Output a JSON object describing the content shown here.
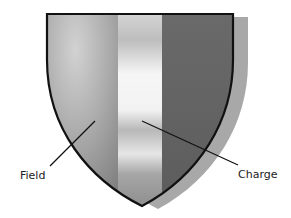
{
  "diagram": {
    "labels": {
      "field": "Field",
      "charge": "Charge"
    },
    "colors": {
      "outline": "#111111",
      "shadow": "#a8a8a8",
      "field_light": "#c8c8c8",
      "field_dark": "#8a8a8a",
      "charge_light": "#f4f4f4",
      "charge_mid": "#bdbdbd",
      "right_stripe": "#6e6e6e",
      "leader_line": "#111111"
    }
  }
}
